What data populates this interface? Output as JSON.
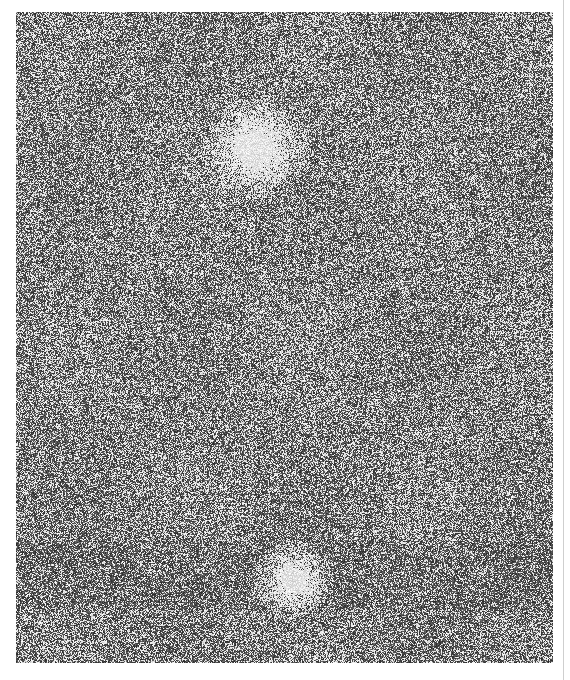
{
  "image": {
    "description": "Grainy astronomical photographic plate showing dense star field noise with two bright diffuse objects",
    "background_color": "#555555",
    "grain_light_color": "#ffffff",
    "grain_dark_color": "#2e2e2e",
    "frame": {
      "x": 16,
      "y": 12,
      "width": 537,
      "height": 651
    },
    "bright_objects": [
      {
        "name": "upper-bright-object",
        "cx": 255,
        "cy": 148,
        "radius": 26
      },
      {
        "name": "lower-bright-object",
        "cx": 293,
        "cy": 580,
        "radius": 18
      }
    ],
    "dark_band": {
      "y_start": 540,
      "y_end": 610
    }
  },
  "caption": {
    "text": ""
  }
}
